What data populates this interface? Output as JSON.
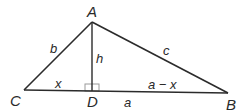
{
  "diagram": {
    "type": "geometry-triangle",
    "colors": {
      "line": "#2b2b2b",
      "right_angle_marker": "#9a9a9a",
      "text": "#2a2a2a",
      "background": "#ffffff"
    },
    "points": {
      "A": {
        "label": "A",
        "x": 92,
        "y": 22
      },
      "B": {
        "label": "B",
        "x": 228,
        "y": 93
      },
      "C": {
        "label": "C",
        "x": 24,
        "y": 90
      },
      "D": {
        "label": "D",
        "x": 92,
        "y": 91
      }
    },
    "sides": {
      "b": {
        "label": "b",
        "from": "C",
        "to": "A"
      },
      "c": {
        "label": "c",
        "from": "A",
        "to": "B"
      },
      "h": {
        "label": "h",
        "from": "A",
        "to": "D"
      },
      "x": {
        "label": "x",
        "from": "C",
        "to": "D"
      },
      "a_minus_x": {
        "label": "a − x",
        "from": "D",
        "to": "B"
      },
      "a": {
        "label": "a",
        "from": "C",
        "to": "B"
      }
    },
    "right_angle_at": "D"
  }
}
